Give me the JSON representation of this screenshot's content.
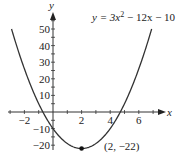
{
  "chart_data": {
    "type": "line",
    "equation": {
      "lhs": "y = 3x",
      "exp": "2",
      "rhs": " − 12x − 10"
    },
    "xlabel": "x",
    "ylabel": "y",
    "xlim": [
      -3,
      7.5
    ],
    "ylim": [
      -25,
      60
    ],
    "x_ticks": [
      -2,
      2,
      4,
      6
    ],
    "x_tick_labels": [
      "−2",
      "2",
      "4",
      "6"
    ],
    "y_ticks": [
      50,
      40,
      30,
      20,
      10,
      -10,
      -20
    ],
    "y_tick_labels": [
      "50",
      "40",
      "30",
      "20",
      "10",
      "−10",
      "−20"
    ],
    "grid": false,
    "series": [
      {
        "name": "y = 3x^2 - 12x - 10",
        "function": "3*x*x - 12*x - 10",
        "x_range": [
          -2.9,
          6.9
        ]
      }
    ],
    "annotations": [
      {
        "point": [
          2,
          -22
        ],
        "label": "(2, −22)"
      }
    ],
    "line_color": "#333333"
  }
}
